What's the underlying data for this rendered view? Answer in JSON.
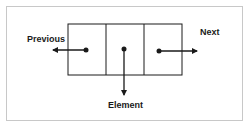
{
  "diagram": {
    "node": {
      "cells": [
        "previous-pointer",
        "element",
        "next-pointer"
      ]
    },
    "labels": {
      "previous": "Previous",
      "element": "Element",
      "next": "Next"
    },
    "colors": {
      "stroke": "#1a1a1a",
      "frame": "#c8c8c8",
      "background": "#ffffff"
    }
  }
}
